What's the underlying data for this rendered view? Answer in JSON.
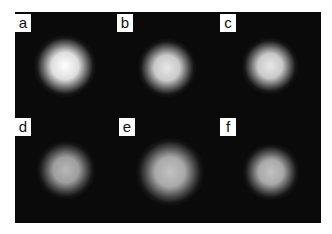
{
  "panels": [
    {
      "label": "a",
      "cx": 65,
      "cy": 66,
      "r": 20,
      "intensity": 1.0
    },
    {
      "label": "b",
      "cx": 167,
      "cy": 68,
      "r": 19,
      "intensity": 0.9
    },
    {
      "label": "c",
      "cx": 270,
      "cy": 66,
      "r": 18,
      "intensity": 0.9
    },
    {
      "label": "d",
      "cx": 66,
      "cy": 170,
      "r": 19,
      "intensity": 0.7
    },
    {
      "label": "e",
      "cx": 170,
      "cy": 172,
      "r": 22,
      "intensity": 0.75
    },
    {
      "label": "f",
      "cx": 271,
      "cy": 172,
      "r": 18,
      "intensity": 0.75
    }
  ],
  "labels_pos": [
    {
      "x": 15,
      "y": 14
    },
    {
      "x": 117,
      "y": 14
    },
    {
      "x": 220,
      "y": 14
    },
    {
      "x": 15,
      "y": 118
    },
    {
      "x": 119,
      "y": 118
    },
    {
      "x": 220,
      "y": 118
    }
  ]
}
